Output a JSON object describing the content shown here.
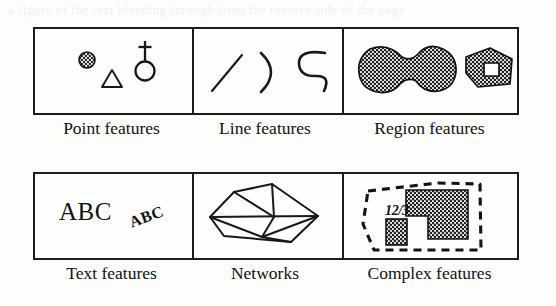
{
  "figure": {
    "kind": "diagram",
    "grid": {
      "rows": 2,
      "columns": 3
    },
    "ghost_bleed_text": "a figure of the text bleeding through from the reverse side of the page"
  },
  "cells": [
    {
      "label": "Point features",
      "glyphs": [
        {
          "name": "filled-circle-point-symbol",
          "fill": "stipple-dark"
        },
        {
          "name": "open-triangle-point-symbol",
          "fill": "none"
        },
        {
          "name": "circle-with-cross-point-symbol",
          "fill": "none"
        }
      ]
    },
    {
      "label": "Line features",
      "glyphs": [
        {
          "name": "straight-line-segment"
        },
        {
          "name": "open-arc-curve"
        },
        {
          "name": "s-shaped-curve"
        }
      ]
    },
    {
      "label": "Region features",
      "glyphs": [
        {
          "name": "peanut-shaped-filled-region",
          "fill": "stipple-dark"
        },
        {
          "name": "polygon-region-with-hole",
          "fill": "stipple-dark",
          "hole": "white-square"
        }
      ]
    },
    {
      "label": "Text features",
      "glyphs": [
        {
          "name": "horizontal-text-label",
          "text": "ABC"
        },
        {
          "name": "rotated-text-label",
          "text": "ABC"
        }
      ]
    },
    {
      "label": "Networks",
      "glyphs": [
        {
          "name": "triangulated-network-graph",
          "nodes": 6
        }
      ]
    },
    {
      "label": "Complex features",
      "glyphs": [
        {
          "name": "dashed-boundary-polygon"
        },
        {
          "name": "l-shaped-filled-region",
          "fill": "stipple-dark"
        },
        {
          "name": "small-filled-rectangle",
          "fill": "stipple-dark"
        },
        {
          "name": "parcel-annotation-text",
          "text": "12/3"
        }
      ]
    }
  ],
  "text": {
    "abc_big": "ABC",
    "abc_small": "ABC",
    "parcel_id": "12/3"
  },
  "colors": {
    "ink": "#1b1b1b",
    "paper": "#fdfdfc",
    "stipple": "#2a2a2a"
  }
}
